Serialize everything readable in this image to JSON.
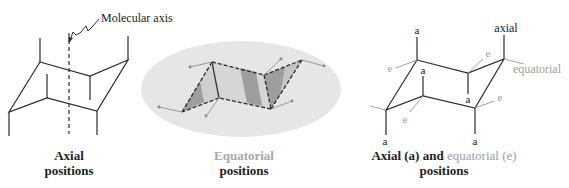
{
  "colors": {
    "line": "#2a2a2a",
    "equatorial": "#9a9a9a",
    "ellipse": "#e4e4e4",
    "shade_dark": "#9e9e9e",
    "shade_light": "#cfcfcf",
    "dot": "#888888"
  },
  "panel_axial": {
    "callout": "Molecular axis",
    "caption_line1": "Axial",
    "caption_line2": "positions"
  },
  "panel_equatorial": {
    "caption_line1": "Equatorial",
    "caption_line2": "positions"
  },
  "panel_combined": {
    "labels": {
      "axial": "axial",
      "equatorial": "equatorial",
      "a": "a",
      "e": "e"
    },
    "caption_bold": "Axial (a) and",
    "caption_gray": "equatorial (e)",
    "caption_line2": "positions"
  }
}
